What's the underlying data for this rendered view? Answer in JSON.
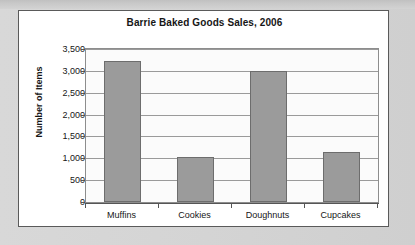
{
  "chart_data": {
    "type": "bar",
    "title": "Barrie Baked Goods Sales, 2006",
    "xlabel": "",
    "ylabel": "Number of Items",
    "categories": [
      "Muffins",
      "Cookies",
      "Doughnuts",
      "Cupcakes"
    ],
    "values": [
      3220,
      1020,
      3000,
      1150
    ],
    "ylim": [
      0,
      3500
    ],
    "ytick_values": [
      0,
      500,
      1000,
      1500,
      2000,
      2500,
      3000,
      3500
    ],
    "ytick_labels": [
      "0",
      "500",
      "1,000",
      "1,500",
      "2,000",
      "2,500",
      "3,000",
      "3,500"
    ],
    "grid": true,
    "legend": false,
    "colors": {
      "bar_fill": "#9b9b9b",
      "bar_stroke": "#6d6d6d",
      "plot_bg": "#fbfbfb",
      "gridline": "#9a9a9a",
      "axis": "#555555",
      "card_bg": "#ffffff",
      "card_border": "#5a5a5a",
      "page_bg": "#d5d5d5",
      "text": "#161616"
    }
  }
}
